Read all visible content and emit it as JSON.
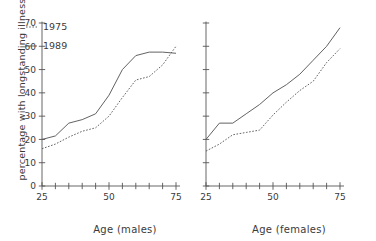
{
  "figure": {
    "ylabel": "percentage with longstanding illness",
    "panels": [
      {
        "id": "males",
        "xlabel": "Age (males)"
      },
      {
        "id": "females",
        "xlabel": "Age (females)"
      }
    ]
  },
  "legend": {
    "entries": [
      {
        "label": "1975",
        "style": "dotted"
      },
      {
        "label": "1989",
        "style": "solid"
      }
    ]
  },
  "axes": {
    "y_ticks": [
      0,
      10,
      20,
      30,
      40,
      50,
      60,
      70
    ],
    "y_tick_labels": [
      "0",
      "10",
      "20",
      "30",
      "40",
      "50",
      "60",
      "70"
    ],
    "x_major_ticks": [
      25,
      50,
      75
    ],
    "x_major_tick_labels": [
      "25",
      "50",
      "75"
    ],
    "x_minor_ticks": [
      30,
      35,
      40,
      45,
      55,
      60,
      65,
      70
    ]
  },
  "colors": {
    "line": "#5a5a5a",
    "axis": "#555555",
    "text": "#3a3a3a",
    "background": "#ffffff"
  },
  "chart_data": {
    "type": "line",
    "title": "",
    "xlabel": "Age",
    "ylabel": "percentage with longstanding illness",
    "xlim": [
      25,
      75
    ],
    "ylim": [
      0,
      70
    ],
    "grid": false,
    "legend_position": "upper-left",
    "panels": [
      {
        "name": "males",
        "xlabel": "Age (males)",
        "x": [
          25,
          30,
          35,
          40,
          45,
          50,
          55,
          60,
          65,
          70,
          75
        ],
        "series": [
          {
            "name": "1975",
            "style": "dotted",
            "values": [
              16,
              18,
              21,
              23.5,
              25,
              30,
              38,
              45.5,
              47,
              52,
              60
            ]
          },
          {
            "name": "1989",
            "style": "solid",
            "values": [
              20,
              21.5,
              27,
              28.5,
              31,
              39,
              50,
              56,
              57.5,
              57.5,
              57
            ]
          }
        ]
      },
      {
        "name": "females",
        "xlabel": "Age (females)",
        "x": [
          25,
          30,
          35,
          40,
          45,
          50,
          55,
          60,
          65,
          70,
          75
        ],
        "series": [
          {
            "name": "1975",
            "style": "dotted",
            "values": [
              15,
              18,
              22,
              23,
              24,
              30.5,
              36,
              41,
              45,
              53,
              59
            ]
          },
          {
            "name": "1989",
            "style": "solid",
            "values": [
              20,
              27,
              27,
              31,
              35,
              40,
              43.5,
              48,
              54,
              60,
              68
            ]
          }
        ]
      }
    ]
  }
}
